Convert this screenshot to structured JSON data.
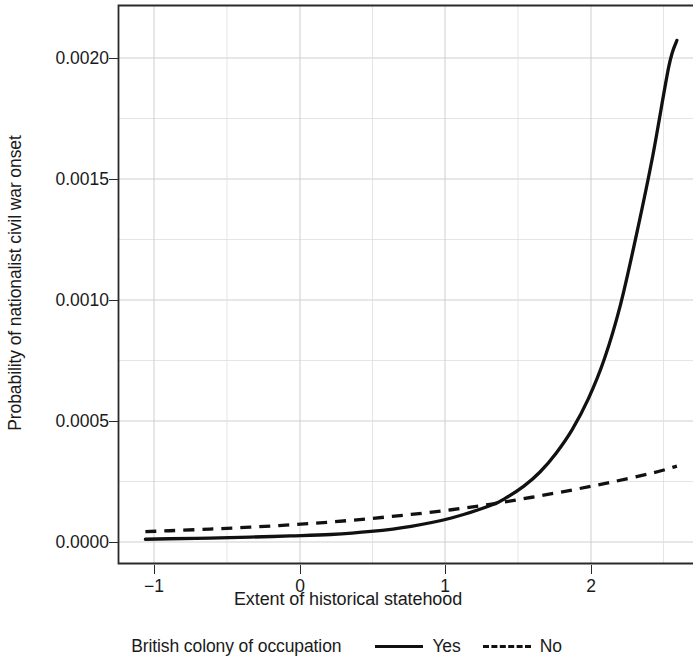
{
  "chart_data": {
    "type": "line",
    "title": "",
    "xlabel": "Extent of historical statehood",
    "ylabel": "Probability of nationalist civil war onset",
    "xlim": [
      -1.32,
      2.25
    ],
    "ylim": [
      -9e-05,
      0.00228
    ],
    "xticks": [
      -1,
      0,
      1,
      2
    ],
    "xtick_labels": [
      "−1",
      "0",
      "1",
      "2"
    ],
    "yticks": [
      0.0,
      0.0005,
      0.001,
      0.0015,
      0.002
    ],
    "ytick_labels": [
      "0.0000",
      "0.0005",
      "0.0010",
      "0.0015",
      "0.0020"
    ],
    "grid": true,
    "grid_minor": true,
    "legend_title": "British colony of occupation",
    "legend_position": "below-plot-center",
    "line_color": "#111111",
    "grid_color": "#c9c9c9",
    "axis_color": "#2a2a2a",
    "series": [
      {
        "name": "Yes",
        "style": "solid",
        "x": [
          -1.15,
          -1.0,
          -0.75,
          -0.5,
          -0.25,
          0.0,
          0.25,
          0.5,
          0.75,
          1.0,
          1.1,
          1.2,
          1.3,
          1.4,
          1.5,
          1.6,
          1.7,
          1.8,
          1.9,
          2.0,
          2.1,
          2.15
        ],
        "y": [
          1.5e-05,
          1.7e-05,
          2e-05,
          2.4e-05,
          2.9e-05,
          3.5e-05,
          4.8e-05,
          7e-05,
          0.000105,
          0.00016,
          0.000195,
          0.00024,
          0.0003,
          0.00038,
          0.00048,
          0.00061,
          0.00078,
          0.00101,
          0.00131,
          0.00164,
          0.00202,
          0.00213
        ]
      },
      {
        "name": "No",
        "style": "dashed",
        "x": [
          -1.15,
          -1.0,
          -0.75,
          -0.5,
          -0.25,
          0.0,
          0.25,
          0.5,
          0.75,
          1.0,
          1.25,
          1.5,
          1.75,
          2.0,
          2.15
        ],
        "y": [
          4.7e-05,
          5.1e-05,
          5.8e-05,
          6.6e-05,
          7.6e-05,
          8.8e-05,
          0.000103,
          0.00012,
          0.00014,
          0.000164,
          0.000193,
          0.000224,
          0.000258,
          0.000296,
          0.000325
        ]
      }
    ],
    "annotations": {
      "crossover_x": 1.22,
      "crossover_y": 0.00019
    }
  }
}
